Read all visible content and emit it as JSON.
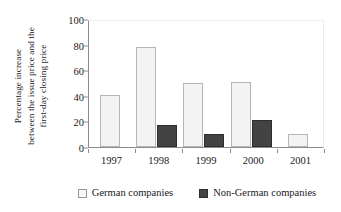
{
  "chart_data": {
    "type": "bar",
    "title": "",
    "subtitle": "",
    "xlabel": "",
    "ylabel": "Percentage increase between the issue price and the first-day closing price",
    "ylabel_lines": [
      "Percentage increase",
      "between the issue price and the",
      "first-day closing price"
    ],
    "categories": [
      "1997",
      "1998",
      "1999",
      "2000",
      "2001"
    ],
    "series": [
      {
        "name": "German companies",
        "color": "#f3f3f3",
        "border_color": "#b6b6b6",
        "values": [
          40.5,
          78.5,
          50.0,
          51.0,
          10.5
        ]
      },
      {
        "name": "Non-German companies",
        "color": "#434343",
        "border_color": "#2d2d2d",
        "values": [
          null,
          17.5,
          10.0,
          21.0,
          null
        ]
      }
    ],
    "ylim": [
      0,
      100
    ],
    "yticks": [
      0,
      20,
      40,
      60,
      80,
      100
    ],
    "ytick_labels": [
      "0",
      "20",
      "40",
      "60",
      "80",
      "100"
    ],
    "grid": false,
    "legend_position": "bottom",
    "legend_entries": [
      "German companies",
      "Non-German companies"
    ]
  }
}
